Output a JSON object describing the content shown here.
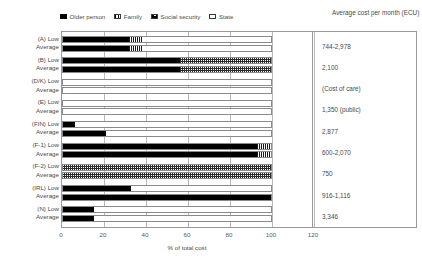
{
  "legend": {
    "items": [
      {
        "label": "Older person",
        "key": "older",
        "color": "#000000"
      },
      {
        "label": "Family",
        "key": "family",
        "color": "#ffffff"
      },
      {
        "label": "Social security",
        "key": "social",
        "color": "#ffffff"
      },
      {
        "label": "State",
        "key": "state",
        "color": "#ffffff"
      }
    ]
  },
  "cost_header": "Average cost  per month (ECU)",
  "axis": {
    "xlabel": "% of total cost",
    "xticks": [
      0,
      20,
      40,
      60,
      80,
      100,
      120
    ],
    "xmin": 0,
    "xmax": 120
  },
  "chart_data": {
    "type": "bar",
    "orientation": "horizontal",
    "stacked": true,
    "title": "",
    "xlabel": "% of total cost",
    "ylabel": "",
    "xlim": [
      0,
      120
    ],
    "grid": true,
    "legend_position": "top",
    "series_names": [
      "Older person",
      "Family",
      "Social security",
      "State"
    ],
    "groups": [
      {
        "country": "(A)",
        "cost": "744-2,978",
        "rows": [
          {
            "label": "(A) Low",
            "older": 32,
            "family": 6,
            "social": 0,
            "state": 62
          },
          {
            "label": "Average",
            "older": 32,
            "family": 6,
            "social": 0,
            "state": 62
          }
        ]
      },
      {
        "country": "(B)",
        "cost": "2,100",
        "rows": [
          {
            "label": "(B) Low",
            "older": 56,
            "family": 0,
            "social": 44,
            "state": 0
          },
          {
            "label": "Average",
            "older": 56,
            "family": 0,
            "social": 44,
            "state": 0
          }
        ]
      },
      {
        "country": "(D/K)",
        "cost": "(Cost of care)",
        "rows": [
          {
            "label": "(D/K) Low",
            "older": 0,
            "family": 0,
            "social": 0,
            "state": 100
          },
          {
            "label": "Average",
            "older": 0,
            "family": 0,
            "social": 0,
            "state": 100
          }
        ]
      },
      {
        "country": "(E)",
        "cost": "1,350 (public)",
        "rows": [
          {
            "label": "(E) Low",
            "older": 0,
            "family": 0,
            "social": 0,
            "state": 100
          },
          {
            "label": "Average",
            "older": 0,
            "family": 0,
            "social": 0,
            "state": 100
          }
        ]
      },
      {
        "country": "(FIN)",
        "cost": "2,877",
        "rows": [
          {
            "label": "(FIN) Low",
            "older": 6,
            "family": 0,
            "social": 0,
            "state": 94
          },
          {
            "label": "Average",
            "older": 21,
            "family": 0,
            "social": 0,
            "state": 79
          }
        ]
      },
      {
        "country": "(F-1)",
        "cost": "600-2,070",
        "rows": [
          {
            "label": "(F-1) Low",
            "older": 93,
            "family": 7,
            "social": 0,
            "state": 0
          },
          {
            "label": "Average",
            "older": 93,
            "family": 7,
            "social": 0,
            "state": 0
          }
        ]
      },
      {
        "country": "(F-2)",
        "cost": "750",
        "rows": [
          {
            "label": "(F-2) Low",
            "older": 0,
            "family": 0,
            "social": 100,
            "state": 0
          },
          {
            "label": "Average",
            "older": 0,
            "family": 0,
            "social": 100,
            "state": 0
          }
        ]
      },
      {
        "country": "(IRL)",
        "cost": "916-1,116",
        "rows": [
          {
            "label": "(IRL) Low",
            "older": 33,
            "family": 0,
            "social": 0,
            "state": 67
          },
          {
            "label": "Average",
            "older": 100,
            "family": 0,
            "social": 0,
            "state": 0
          }
        ]
      },
      {
        "country": "(N)",
        "cost": "3,346",
        "rows": [
          {
            "label": "(N) Low",
            "older": 15,
            "family": 0,
            "social": 0,
            "state": 85
          },
          {
            "label": "Average",
            "older": 15,
            "family": 0,
            "social": 0,
            "state": 85
          }
        ]
      }
    ]
  }
}
